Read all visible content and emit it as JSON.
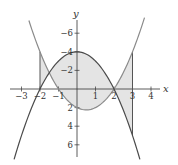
{
  "chart_data": {
    "type": "line",
    "title": "",
    "xlabel": "x",
    "ylabel": "y",
    "xlim": [
      -3.3,
      4.5
    ],
    "ylim": [
      -7.3,
      7.8
    ],
    "x_ticks": [
      -3,
      -2,
      -1,
      1,
      2,
      3,
      4
    ],
    "y_ticks": [
      -6,
      -4,
      -2,
      2,
      4,
      6
    ],
    "grid": false,
    "legend": null,
    "series": [
      {
        "name": "y = 4 - x^2",
        "expression": "4 - x^2",
        "domain": [
          -3.4,
          3.4
        ],
        "color": "#4a4a4a",
        "points": [
          [
            -3,
            -5
          ],
          [
            -2,
            0
          ],
          [
            -1,
            3
          ],
          [
            0,
            4
          ],
          [
            1,
            3
          ],
          [
            2,
            0
          ],
          [
            3,
            -5
          ]
        ]
      },
      {
        "name": "y = x^2 - x - 2",
        "expression": "x^2 - x - 2",
        "domain": [
          -2.6,
          3.65
        ],
        "color": "#8a8a8a",
        "points": [
          [
            -2,
            4
          ],
          [
            -1,
            0
          ],
          [
            0,
            -2
          ],
          [
            0.5,
            -2.25
          ],
          [
            1,
            -2
          ],
          [
            2,
            0
          ],
          [
            3,
            4
          ]
        ]
      }
    ],
    "shaded_region": {
      "between": [
        "4 - x^2",
        "x^2 - x - 2"
      ],
      "x_range": [
        -2,
        3
      ],
      "color": "#e4e4e4"
    },
    "vertical_lines": [
      {
        "x": -2,
        "y_from": 0,
        "y_to": 4
      },
      {
        "x": 3,
        "y_from": -5,
        "y_to": 4
      }
    ],
    "intersections": [
      [
        -2,
        0
      ],
      [
        2,
        0
      ]
    ]
  },
  "axes": {
    "x_label": "x",
    "y_label": "y",
    "x_tick_labels": [
      "−3",
      "−2",
      "−1",
      "1",
      "2",
      "3",
      "4"
    ],
    "y_tick_labels": [
      "6",
      "4",
      "2",
      "−2",
      "−4",
      "−6"
    ]
  },
  "colors": {
    "axis": "#333333",
    "curve_a": "#4a4a4a",
    "curve_b": "#8a8a8a",
    "shade": "#e4e4e4"
  }
}
